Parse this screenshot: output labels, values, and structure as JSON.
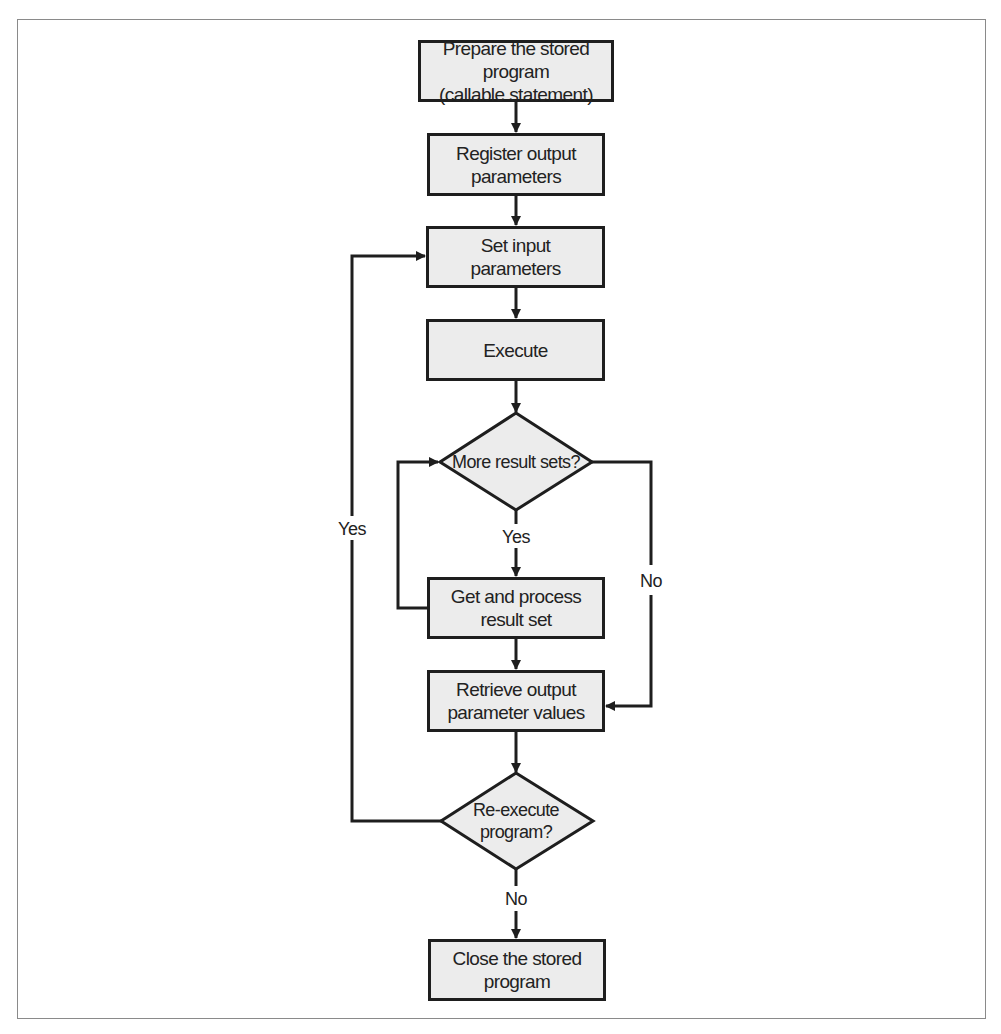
{
  "diagram": {
    "type": "flowchart",
    "nodes": {
      "prepare": {
        "label": "Prepare the stored program\n(callable statement)",
        "shape": "process"
      },
      "register": {
        "label": "Register output\nparameters",
        "shape": "process"
      },
      "set_input": {
        "label": "Set input\nparameters",
        "shape": "process"
      },
      "execute": {
        "label": "Execute",
        "shape": "process"
      },
      "more_results": {
        "label": "More result sets?",
        "shape": "decision"
      },
      "get_process": {
        "label": "Get and process\nresult set",
        "shape": "process"
      },
      "retrieve": {
        "label": "Retrieve output\nparameter values",
        "shape": "process"
      },
      "reexecute": {
        "label": "Re-execute\nprogram?",
        "shape": "decision"
      },
      "close": {
        "label": "Close the stored\nprogram",
        "shape": "process"
      }
    },
    "edge_labels": {
      "more_yes": "Yes",
      "more_no": "No",
      "reexec_yes": "Yes",
      "reexec_no": "No"
    },
    "edges": [
      {
        "from": "prepare",
        "to": "register"
      },
      {
        "from": "register",
        "to": "set_input"
      },
      {
        "from": "set_input",
        "to": "execute"
      },
      {
        "from": "execute",
        "to": "more_results"
      },
      {
        "from": "more_results",
        "to": "get_process",
        "label": "Yes"
      },
      {
        "from": "get_process",
        "to": "more_results"
      },
      {
        "from": "more_results",
        "to": "retrieve",
        "label": "No"
      },
      {
        "from": "get_process",
        "to": "retrieve"
      },
      {
        "from": "retrieve",
        "to": "reexecute"
      },
      {
        "from": "reexecute",
        "to": "set_input",
        "label": "Yes"
      },
      {
        "from": "reexecute",
        "to": "close",
        "label": "No"
      }
    ],
    "colors": {
      "box_fill": "#ececec",
      "stroke": "#1e1e1e",
      "frame": "#8a8a8a"
    }
  }
}
